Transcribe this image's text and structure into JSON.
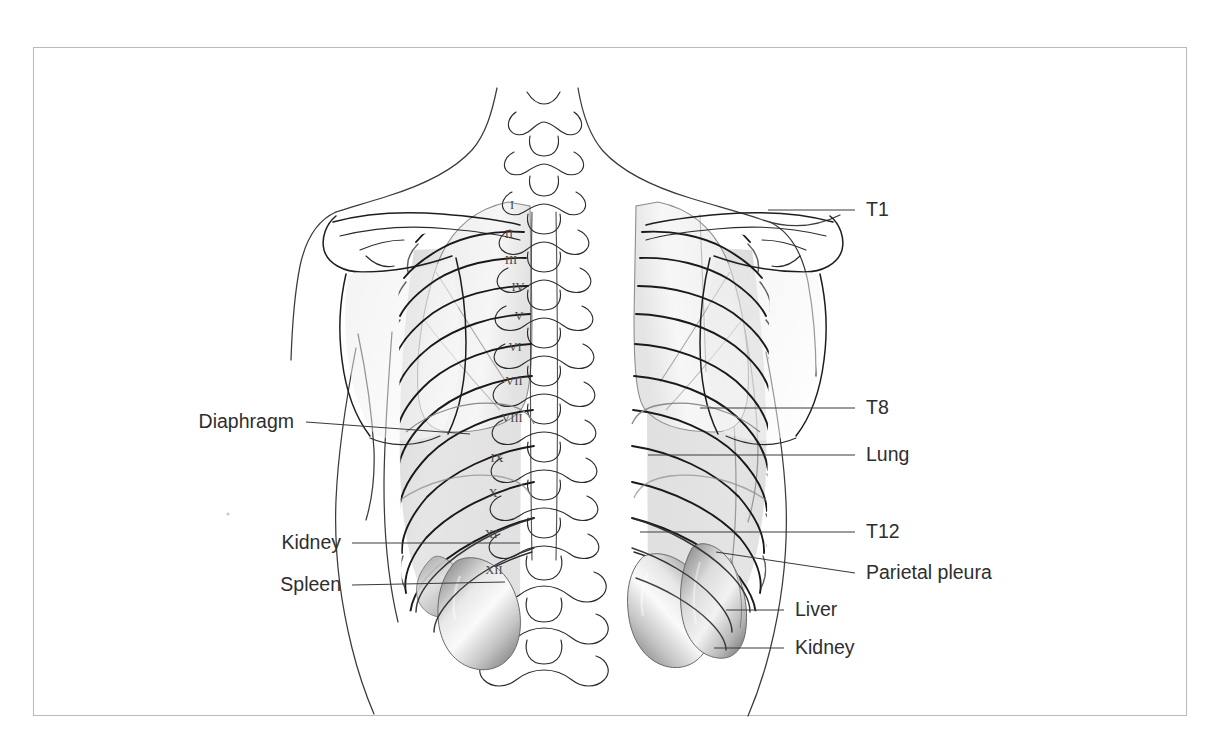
{
  "figure": {
    "border_color": "#b9b9b9",
    "background_color": "#ffffff",
    "ink_color": "#1d1d1d",
    "label_color": "#2e2e2e",
    "leader_color": "#3a3a3a"
  },
  "labels_right": [
    {
      "id": "t1",
      "text": "T1",
      "x": 866,
      "y": 216,
      "leader_x1": 768,
      "leader_y1": 210,
      "leader_x2": 855,
      "leader_y2": 210
    },
    {
      "id": "t8",
      "text": "T8",
      "x": 866,
      "y": 414,
      "leader_x1": 700,
      "leader_y1": 408,
      "leader_x2": 855,
      "leader_y2": 408
    },
    {
      "id": "lung",
      "text": "Lung",
      "x": 866,
      "y": 461,
      "leader_x1": 648,
      "leader_y1": 455,
      "leader_x2": 855,
      "leader_y2": 455
    },
    {
      "id": "t12",
      "text": "T12",
      "x": 866,
      "y": 538,
      "leader_x1": 640,
      "leader_y1": 532,
      "leader_x2": 855,
      "leader_y2": 532
    },
    {
      "id": "parietal-pleura",
      "text": "Parietal pleura",
      "x": 866,
      "y": 579,
      "leader_x1": 716,
      "leader_y1": 552,
      "leader_x2": 855,
      "leader_y2": 573
    },
    {
      "id": "liver",
      "text": "Liver",
      "x": 795,
      "y": 616,
      "leader_x1": 726,
      "leader_y1": 610,
      "leader_x2": 784,
      "leader_y2": 610
    },
    {
      "id": "kidney-right",
      "text": "Kidney",
      "x": 795,
      "y": 654,
      "leader_x1": 714,
      "leader_y1": 648,
      "leader_x2": 784,
      "leader_y2": 648
    }
  ],
  "labels_left": [
    {
      "id": "diaphragm",
      "text": "Diaphragm",
      "x": 294,
      "y": 428,
      "leader_x1": 306,
      "leader_y1": 422,
      "leader_x2": 470,
      "leader_y2": 434
    },
    {
      "id": "kidney-left",
      "text": "Kidney",
      "x": 341,
      "y": 549,
      "leader_x1": 352,
      "leader_y1": 543,
      "leader_x2": 520,
      "leader_y2": 543
    },
    {
      "id": "spleen",
      "text": "Spleen",
      "x": 341,
      "y": 591,
      "leader_x1": 352,
      "leader_y1": 585,
      "leader_x2": 505,
      "leader_y2": 582
    }
  ],
  "rib_numerals": [
    {
      "numeral": "I",
      "x": 512,
      "y": 209
    },
    {
      "numeral": "II",
      "x": 509,
      "y": 238
    },
    {
      "numeral": "III",
      "x": 511,
      "y": 264
    },
    {
      "numeral": "IV",
      "x": 518,
      "y": 291
    },
    {
      "numeral": "V",
      "x": 519,
      "y": 320
    },
    {
      "numeral": "VI",
      "x": 515,
      "y": 351
    },
    {
      "numeral": "VII",
      "x": 514,
      "y": 385
    },
    {
      "numeral": "VIII",
      "x": 512,
      "y": 422
    },
    {
      "numeral": "IX",
      "x": 497,
      "y": 462
    },
    {
      "numeral": "X",
      "x": 493,
      "y": 497
    },
    {
      "numeral": "XI",
      "x": 491,
      "y": 538
    },
    {
      "numeral": "XII",
      "x": 494,
      "y": 574
    }
  ]
}
